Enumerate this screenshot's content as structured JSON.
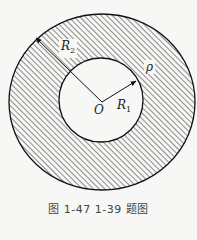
{
  "figure": {
    "caption": "图 1-47   1-39 题图",
    "labels": {
      "outer_radius": {
        "symbol": "R",
        "sub": "2"
      },
      "inner_radius": {
        "symbol": "R",
        "sub": "1"
      },
      "density": "ρ",
      "center": "O"
    },
    "geometry": {
      "outer": {
        "cx": 102,
        "cy": 102,
        "rx": 93,
        "ry": 88
      },
      "inner": {
        "cx": 101,
        "cy": 100,
        "r": 42
      },
      "hatch_color": "#333333",
      "stroke_color": "#111111"
    }
  }
}
